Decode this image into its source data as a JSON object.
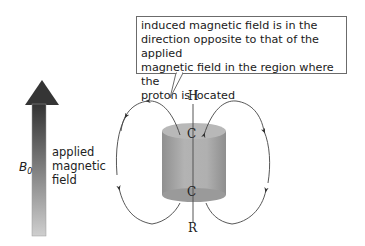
{
  "callout": {
    "text": "induced magnetic field is in the direction opposite to that of the applied magnetic field in the region where the proton is located",
    "lines": [
      "induced magnetic field is in the",
      "direction opposite to that of the applied",
      "magnetic field in the region where the",
      "proton is located"
    ]
  },
  "applied_field": {
    "symbol": "B",
    "subscript": "0",
    "label_lines": [
      "applied",
      "magnetic",
      "field"
    ],
    "arrow_color_top": "#3a3a3a",
    "arrow_color_bottom": "#c8c8c8"
  },
  "molecule": {
    "atoms": [
      "H",
      "C",
      "C",
      "R"
    ],
    "cylinder_color": "#a9a9a9"
  }
}
